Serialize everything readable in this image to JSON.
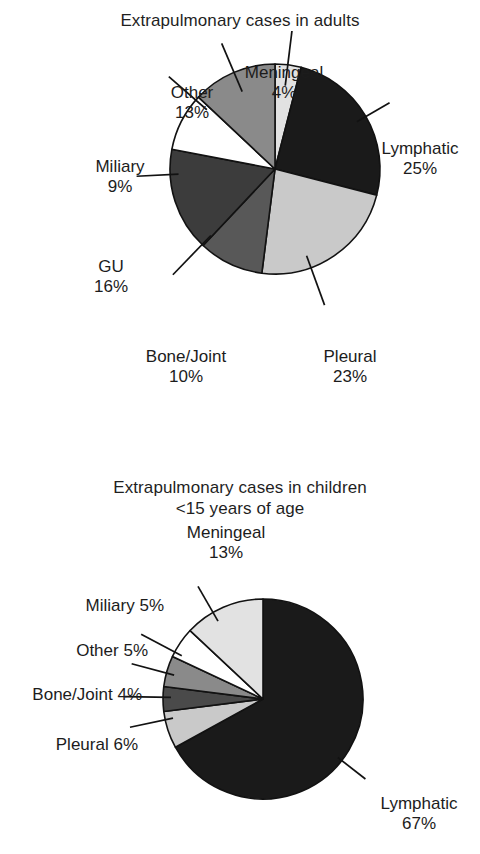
{
  "chart_data": [
    {
      "type": "pie",
      "title": "Extrapulmonary cases in adults",
      "categories": [
        "Meningeal",
        "Lymphatic",
        "Pleural",
        "Bone/Joint",
        "GU",
        "Miliary",
        "Other"
      ],
      "values": [
        4,
        25,
        23,
        10,
        16,
        9,
        13
      ],
      "unit": "%",
      "labels": [
        {
          "name": "Meningeal",
          "value": "4%"
        },
        {
          "name": "Lymphatic",
          "value": "25%"
        },
        {
          "name": "Pleural",
          "value": "23%"
        },
        {
          "name": "Bone/Joint",
          "value": "10%"
        },
        {
          "name": "GU",
          "value": "16%"
        },
        {
          "name": "Miliary",
          "value": "9%"
        },
        {
          "name": "Other",
          "value": "13%"
        }
      ],
      "colors": [
        "#e2e2e2",
        "#1a1a1a",
        "#c9c9c9",
        "#585858",
        "#3c3c3c",
        "#ffffff",
        "#8a8a8a"
      ],
      "legend": "none",
      "start_angle_deg": 0,
      "direction": "clockwise"
    },
    {
      "type": "pie",
      "title_line1": "Extrapulmonary cases in children",
      "title_line2": "<15 years of age",
      "categories": [
        "Lymphatic",
        "Pleural",
        "Bone/Joint",
        "Other",
        "Miliary",
        "Meningeal"
      ],
      "values": [
        67,
        6,
        4,
        5,
        5,
        13
      ],
      "unit": "%",
      "labels": [
        {
          "name": "Lymphatic",
          "value": "67%"
        },
        {
          "name": "Pleural",
          "value": "6%"
        },
        {
          "name": "Bone/Joint",
          "value": "4%"
        },
        {
          "name": "Other",
          "value": "5%"
        },
        {
          "name": "Miliary",
          "value": "5%"
        },
        {
          "name": "Meningeal",
          "value": "13%"
        }
      ],
      "colors": [
        "#1a1a1a",
        "#c9c9c9",
        "#4a4a4a",
        "#8a8a8a",
        "#ffffff",
        "#e2e2e2"
      ],
      "legend": "none",
      "start_angle_deg": 0,
      "direction": "clockwise"
    }
  ],
  "adults": {
    "title": "Extrapulmonary cases in adults",
    "labels": {
      "other": {
        "name": "Other",
        "value": "13%"
      },
      "meningeal": {
        "name": "Meningeal",
        "value": "4%"
      },
      "lymphatic": {
        "name": "Lymphatic",
        "value": "25%"
      },
      "miliary": {
        "name": "Miliary",
        "value": "9%"
      },
      "gu": {
        "name": "GU",
        "value": "16%"
      },
      "bonejoint": {
        "name": "Bone/Joint",
        "value": "10%"
      },
      "pleural": {
        "name": "Pleural",
        "value": "23%"
      }
    }
  },
  "children": {
    "title_line1": "Extrapulmonary cases in children",
    "title_line2": "<15 years of age",
    "labels": {
      "meningeal": {
        "name": "Meningeal",
        "value": "13%"
      },
      "miliary": {
        "name": "Miliary",
        "value": "5%"
      },
      "other": {
        "name": "Other",
        "value": "5%"
      },
      "bonejoint": {
        "name": "Bone/Joint",
        "value": "4%"
      },
      "pleural": {
        "name": "Pleural",
        "value": "6%"
      },
      "lymphatic": {
        "name": "Lymphatic",
        "value": "67%"
      }
    }
  }
}
